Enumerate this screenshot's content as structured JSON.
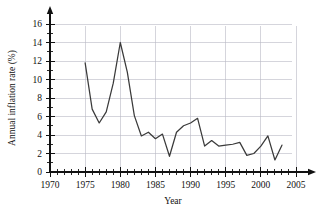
{
  "chart_data": {
    "type": "line",
    "title": "",
    "xlabel": "Year",
    "ylabel": "Annual inflation rate (%)",
    "xlim": [
      1970,
      2005
    ],
    "ylim": [
      0,
      16
    ],
    "grid": true,
    "legend": "none",
    "x_tick_labels": [
      "1970",
      "1975",
      "1980",
      "1985",
      "1990",
      "1995",
      "2000",
      "2005"
    ],
    "x_tick_values": [
      1970,
      1975,
      1980,
      1985,
      1990,
      1995,
      2000,
      2005
    ],
    "x_minor_tick_step": 1,
    "y_tick_labels": [
      "0",
      "2",
      "4",
      "6",
      "8",
      "10",
      "12",
      "14",
      "16"
    ],
    "y_tick_values": [
      0,
      2,
      4,
      6,
      8,
      10,
      12,
      14,
      16
    ],
    "y_minor_tick_step": 1,
    "series": [
      {
        "name": "Annual inflation rate",
        "color": "#3a3a3a",
        "x": [
          1975,
          1976,
          1977,
          1978,
          1979,
          1980,
          1981,
          1982,
          1983,
          1984,
          1985,
          1986,
          1987,
          1988,
          1989,
          1990,
          1991,
          1992,
          1993,
          1994,
          1995,
          1996,
          1997,
          1998,
          1999,
          2000,
          2001,
          2002,
          2003
        ],
        "values": [
          11.8,
          6.8,
          5.3,
          6.5,
          9.6,
          14.0,
          10.8,
          6.1,
          3.9,
          4.3,
          3.6,
          4.1,
          1.7,
          4.3,
          5.0,
          5.3,
          5.8,
          2.8,
          3.4,
          2.8,
          2.9,
          3.0,
          3.2,
          1.8,
          2.0,
          2.8,
          3.9,
          1.3,
          2.9
        ]
      }
    ]
  },
  "axes_geometry": {
    "x_pixel_1970": 50,
    "x_pixel_2005": 296,
    "y_pixel_0": 172,
    "y_pixel_16": 24
  },
  "colors": {
    "line": "#3a3a3a",
    "grid": "#b9b9c4",
    "axis": "#111111",
    "background": "#ffffff"
  }
}
